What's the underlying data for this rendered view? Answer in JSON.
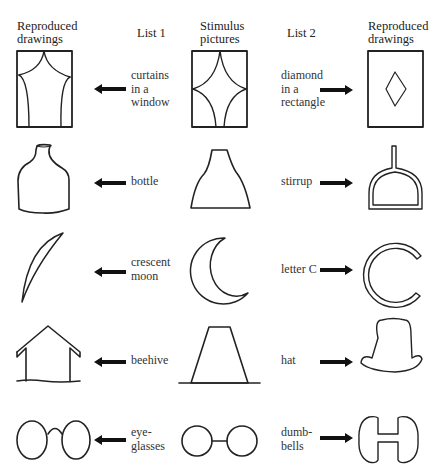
{
  "headers": {
    "left_reproduced": [
      "Reproduced",
      "drawings"
    ],
    "list1": "List 1",
    "stimulus": [
      "Stimulus",
      "pictures"
    ],
    "list2": "List 2",
    "right_reproduced": [
      "Reproduced",
      "drawings"
    ]
  },
  "rows": [
    {
      "stimulus": "curtains-diamond-box",
      "list1": [
        "curtains",
        "in a",
        "window"
      ],
      "list2": [
        "diamond",
        "in a",
        "rectangle"
      ]
    },
    {
      "stimulus": "flared-bottle-shape",
      "list1": [
        "bottle"
      ],
      "list2": [
        "stirrup"
      ]
    },
    {
      "stimulus": "crescent-shape",
      "list1": [
        "crescent",
        "moon"
      ],
      "list2": [
        "letter C"
      ]
    },
    {
      "stimulus": "trapezoid-shape",
      "list1": [
        "beehive"
      ],
      "list2": [
        "hat"
      ]
    },
    {
      "stimulus": "two-circles-joined",
      "list1": [
        "eye-",
        "glasses"
      ],
      "list2": [
        "dumb-",
        "bells"
      ]
    }
  ],
  "colors": {
    "ink": "#222222",
    "background": "#ffffff"
  }
}
